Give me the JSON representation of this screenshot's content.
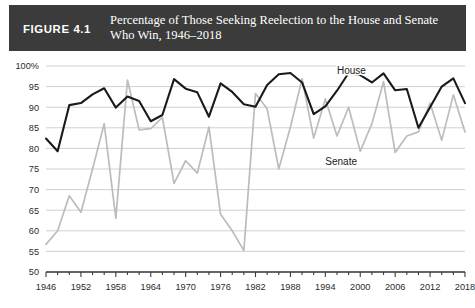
{
  "header": {
    "figure_number": "FIGURE 4.1",
    "title": "Percentage of Those Seeking Reelection to the House and Senate Who Win, 1946–2018"
  },
  "colors": {
    "header_background": "#3b3b3b",
    "header_text": "#ffffff",
    "house_line": "#1a1a1a",
    "senate_line": "#bcbcbc",
    "gridline": "#c9c9c9",
    "axis": "#3b3b3b",
    "page_background": "#ffffff"
  },
  "chart_data": {
    "type": "line",
    "title": "Percentage of Those Seeking Reelection to the House and Senate Who Win, 1946–2018",
    "xlabel": "",
    "ylabel": "",
    "xlim": [
      1946,
      2018
    ],
    "ylim": [
      50,
      100
    ],
    "grid": true,
    "legend_position": "inline-annotation",
    "x": [
      1946,
      1948,
      1950,
      1952,
      1954,
      1956,
      1958,
      1960,
      1962,
      1964,
      1966,
      1968,
      1970,
      1972,
      1974,
      1976,
      1978,
      1980,
      1982,
      1984,
      1986,
      1988,
      1990,
      1992,
      1994,
      1996,
      1998,
      2000,
      2002,
      2004,
      2006,
      2008,
      2010,
      2012,
      2014,
      2016,
      2018
    ],
    "x_tick_labels": [
      "1946",
      "1952",
      "1958",
      "1964",
      "1970",
      "1976",
      "1982",
      "1988",
      "1994",
      "2000",
      "2006",
      "2012",
      "2018"
    ],
    "y_tick_labels": [
      "100%",
      "95",
      "90",
      "85",
      "80",
      "75",
      "70",
      "65",
      "60",
      "55",
      "50"
    ],
    "y_ticks": [
      100,
      95,
      90,
      85,
      80,
      75,
      70,
      65,
      60,
      55,
      50
    ],
    "series": [
      {
        "name": "House",
        "color": "#1a1a1a",
        "label_x": 1996,
        "label_y": 98,
        "values": [
          82.4,
          79.3,
          90.5,
          91.0,
          93.1,
          94.6,
          89.9,
          92.6,
          91.5,
          86.6,
          88.1,
          96.8,
          94.5,
          93.6,
          87.7,
          95.8,
          93.7,
          90.7,
          90.1,
          95.4,
          98.0,
          98.3,
          96.0,
          88.3,
          90.2,
          94.0,
          98.3,
          97.8,
          96.0,
          98.2,
          94.1,
          94.4,
          85.0,
          90.0,
          95.0,
          97.0,
          91.0
        ]
      },
      {
        "name": "Senate",
        "color": "#bcbcbc",
        "label_x": 1994,
        "label_y": 76,
        "values": [
          56.7,
          60.0,
          68.5,
          64.5,
          75.0,
          86.0,
          63.0,
          96.6,
          84.5,
          84.8,
          87.5,
          71.5,
          77.0,
          74.0,
          85.2,
          64.0,
          60.0,
          55.2,
          93.3,
          89.6,
          75.0,
          85.2,
          96.9,
          82.5,
          92.0,
          83.0,
          90.0,
          79.3,
          86.0,
          96.2,
          79.0,
          83.0,
          84.0,
          91.0,
          82.0,
          93.0,
          84.0
        ]
      }
    ]
  }
}
